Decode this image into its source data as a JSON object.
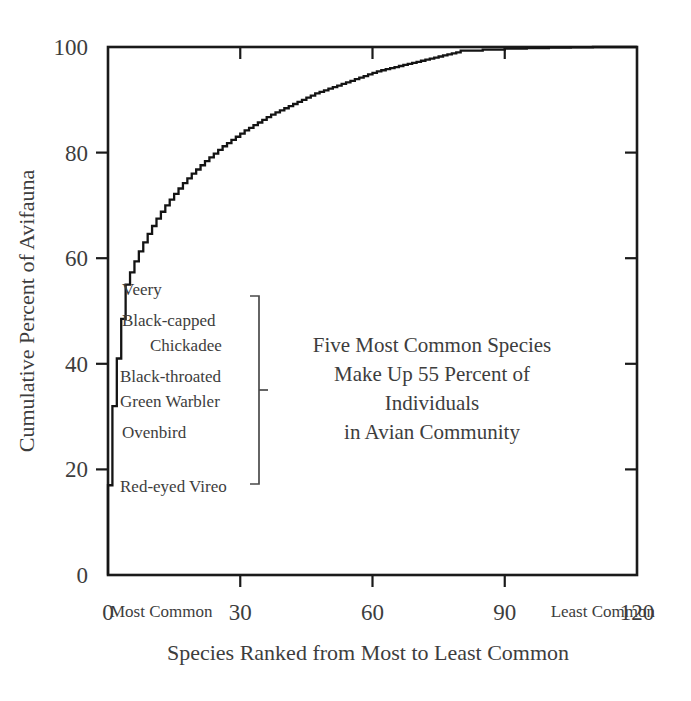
{
  "chart_data": {
    "type": "line",
    "title": "",
    "subtitle": "",
    "xlabel": "Species Ranked from Most to Least Common",
    "ylabel": "Cumulative Percent of Avifauna",
    "xlim": [
      0,
      120
    ],
    "ylim": [
      0,
      100
    ],
    "xticks": [
      0,
      30,
      60,
      90,
      120
    ],
    "xtick_labels": [
      "0",
      "30",
      "60",
      "90",
      "120"
    ],
    "yticks": [
      0,
      20,
      40,
      60,
      80,
      100
    ],
    "ytick_labels": [
      "0",
      "20",
      "40",
      "60",
      "80",
      "100"
    ],
    "grid": false,
    "legend": false,
    "step_style": "post",
    "x": [
      0,
      1,
      2,
      3,
      4,
      5,
      6,
      7,
      8,
      9,
      10,
      11,
      12,
      13,
      14,
      15,
      16,
      17,
      18,
      19,
      20,
      21,
      22,
      23,
      24,
      25,
      26,
      27,
      28,
      29,
      30,
      31,
      32,
      33,
      34,
      35,
      36,
      37,
      38,
      39,
      40,
      41,
      42,
      43,
      44,
      45,
      46,
      47,
      48,
      49,
      50,
      51,
      52,
      53,
      54,
      55,
      56,
      57,
      58,
      59,
      60,
      61,
      62,
      63,
      64,
      65,
      66,
      67,
      68,
      69,
      70,
      71,
      72,
      73,
      74,
      75,
      76,
      77,
      78,
      79,
      80,
      85,
      90,
      95,
      100,
      105,
      110,
      115,
      120
    ],
    "y": [
      0,
      17.0,
      32.0,
      41.0,
      48.5,
      55.0,
      57.3,
      59.4,
      61.3,
      63.0,
      64.6,
      66.1,
      67.5,
      68.8,
      70.0,
      71.1,
      72.2,
      73.2,
      74.2,
      75.1,
      76.0,
      76.8,
      77.6,
      78.4,
      79.1,
      79.8,
      80.5,
      81.2,
      81.8,
      82.4,
      83.0,
      83.6,
      84.2,
      84.7,
      85.2,
      85.7,
      86.2,
      86.7,
      87.2,
      87.6,
      88.0,
      88.4,
      88.8,
      89.2,
      89.6,
      90.0,
      90.4,
      90.8,
      91.2,
      91.5,
      91.8,
      92.1,
      92.4,
      92.7,
      93.0,
      93.3,
      93.6,
      93.9,
      94.2,
      94.5,
      94.8,
      95.1,
      95.4,
      95.6,
      95.8,
      96.0,
      96.2,
      96.4,
      96.6,
      96.8,
      97.0,
      97.2,
      97.4,
      97.6,
      97.8,
      98.0,
      98.2,
      98.4,
      98.6,
      98.8,
      99.0,
      99.3,
      99.5,
      99.7,
      99.8,
      99.9,
      99.95,
      100.0,
      100.0
    ],
    "series_name": "Cumulative percent of avifauna by species rank"
  },
  "axes": {
    "y_title": "Cumulative Percent of Avifauna",
    "x_title": "Species Ranked from Most to Least Common",
    "x_left_end_label": "Most Common",
    "x_right_end_label": "Least Common",
    "x_tick_labels": [
      "0",
      "30",
      "60",
      "90",
      "120"
    ],
    "y_tick_labels": [
      "0",
      "20",
      "40",
      "60",
      "80",
      "100"
    ]
  },
  "species_labels": [
    {
      "name": "Veery",
      "rank": 5,
      "cumulative_percent": 55.0
    },
    {
      "name": "Black-capped",
      "rank": 4,
      "cumulative_percent": 48.5
    },
    {
      "name": "Chickadee",
      "rank": 4,
      "cumulative_percent": 48.5
    },
    {
      "name": "Black-throated",
      "rank": 3,
      "cumulative_percent": 41.0
    },
    {
      "name": "Green Warbler",
      "rank": 3,
      "cumulative_percent": 41.0
    },
    {
      "name": "Ovenbird",
      "rank": 2,
      "cumulative_percent": 32.0
    },
    {
      "name": "Red-eyed Vireo",
      "rank": 1,
      "cumulative_percent": 17.0
    }
  ],
  "annotation": {
    "lines": [
      "Five Most Common Species",
      "Make Up 55 Percent of",
      "Individuals",
      "in Avian Community"
    ],
    "percent": "55",
    "species_count": "Five"
  },
  "colors": {
    "curve": "#141414",
    "axis": "#1a1a1a",
    "text": "#3d3d3d",
    "bracket": "#4a4a4a",
    "background": "#ffffff"
  }
}
